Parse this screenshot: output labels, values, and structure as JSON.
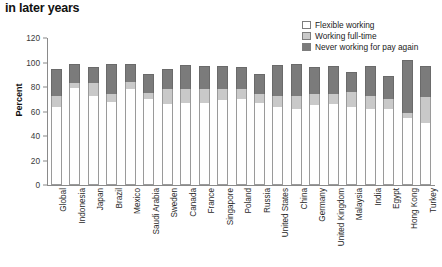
{
  "title": "in later years",
  "footer_note": "",
  "legend": {
    "position": "top-right",
    "items": [
      {
        "label": "Flexible working",
        "color": "#ffffff",
        "key": "flexible"
      },
      {
        "label": "Working full-time",
        "color": "#c9c9c9",
        "key": "fulltime"
      },
      {
        "label": "Never working for pay again",
        "color": "#7b7b7b",
        "key": "never"
      }
    ]
  },
  "axis": {
    "ylabel": "Percent",
    "yticks": [
      "0",
      "20",
      "40",
      "60",
      "80",
      "100",
      "120"
    ]
  },
  "chart_data": {
    "type": "bar",
    "title": "in later years",
    "subtype": "stacked-vertical",
    "xlabel": "",
    "ylabel": "Percent",
    "ylim": [
      0,
      120
    ],
    "ytick_step": 20,
    "grid": false,
    "legend_position": "top-right",
    "categories": [
      "Global",
      "Indonesia",
      "Japan",
      "Brazil",
      "Mexico",
      "Saudi Arabia",
      "Sweden",
      "Canada",
      "France",
      "Singapore",
      "Poland",
      "Russia",
      "United States",
      "China",
      "Germany",
      "United Kingdom",
      "Malaysia",
      "India",
      "Egypt",
      "Hong Kong",
      "Turkey"
    ],
    "series": [
      {
        "name": "Flexible working",
        "color": "#ffffff",
        "values": [
          64,
          79,
          73,
          68,
          78,
          70,
          66,
          67,
          67,
          69,
          70,
          67,
          64,
          62,
          65,
          66,
          64,
          62,
          62,
          55,
          51
        ]
      },
      {
        "name": "Working full-time",
        "color": "#c9c9c9",
        "values": [
          9,
          4,
          10,
          6,
          6,
          5,
          12,
          11,
          11,
          9,
          8,
          7,
          9,
          11,
          9,
          8,
          12,
          11,
          8,
          4,
          21
        ]
      },
      {
        "name": "Never working for pay again",
        "color": "#7b7b7b",
        "values": [
          22,
          16,
          13,
          25,
          15,
          16,
          17,
          20,
          19,
          19,
          18,
          17,
          25,
          26,
          22,
          23,
          16,
          24,
          19,
          43,
          25
        ]
      }
    ],
    "totals": [
      95,
      99,
      96,
      99,
      99,
      91,
      95,
      98,
      97,
      97,
      96,
      91,
      98,
      99,
      96,
      97,
      92,
      97,
      89,
      102,
      97
    ]
  }
}
